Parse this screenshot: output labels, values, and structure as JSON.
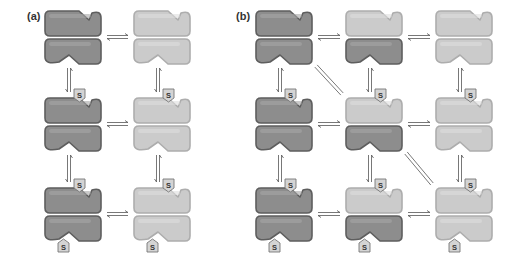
{
  "panels": [
    {
      "label": "(a)",
      "label_pos": [
        27,
        20
      ],
      "columns_x": [
        45,
        134
      ],
      "rows_y": [
        11,
        98,
        188
      ],
      "states": [
        {
          "row": 0,
          "col": 0,
          "top": "dark",
          "bottom": "dark",
          "s_top": false,
          "s_bottom": false
        },
        {
          "row": 0,
          "col": 1,
          "top": "light",
          "bottom": "light",
          "s_top": false,
          "s_bottom": false
        },
        {
          "row": 1,
          "col": 0,
          "top": "dark",
          "bottom": "dark",
          "s_top": true,
          "s_bottom": false
        },
        {
          "row": 1,
          "col": 1,
          "top": "light",
          "bottom": "light",
          "s_top": true,
          "s_bottom": false
        },
        {
          "row": 2,
          "col": 0,
          "top": "dark",
          "bottom": "dark",
          "s_top": true,
          "s_bottom": true
        },
        {
          "row": 2,
          "col": 1,
          "top": "light",
          "bottom": "light",
          "s_top": true,
          "s_bottom": true
        }
      ],
      "h_arrows": [
        [
          0,
          0
        ],
        [
          1,
          0
        ],
        [
          2,
          0
        ]
      ],
      "v_arrows": [
        [
          0,
          0
        ],
        [
          0,
          1
        ],
        [
          1,
          0
        ],
        [
          1,
          1
        ]
      ],
      "d_arrows": []
    },
    {
      "label": "(b)",
      "label_pos": [
        236,
        20
      ],
      "columns_x": [
        256,
        346,
        436
      ],
      "rows_y": [
        11,
        98,
        188
      ],
      "states": [
        {
          "row": 0,
          "col": 0,
          "top": "dark",
          "bottom": "dark",
          "s_top": false,
          "s_bottom": false
        },
        {
          "row": 0,
          "col": 1,
          "top": "light",
          "bottom": "dark",
          "s_top": false,
          "s_bottom": false
        },
        {
          "row": 0,
          "col": 2,
          "top": "light",
          "bottom": "light",
          "s_top": false,
          "s_bottom": false
        },
        {
          "row": 1,
          "col": 0,
          "top": "dark",
          "bottom": "dark",
          "s_top": true,
          "s_bottom": false
        },
        {
          "row": 1,
          "col": 1,
          "top": "light",
          "bottom": "dark",
          "s_top": true,
          "s_bottom": false
        },
        {
          "row": 1,
          "col": 2,
          "top": "light",
          "bottom": "light",
          "s_top": true,
          "s_bottom": false
        },
        {
          "row": 2,
          "col": 0,
          "top": "dark",
          "bottom": "dark",
          "s_top": true,
          "s_bottom": true
        },
        {
          "row": 2,
          "col": 1,
          "top": "light",
          "bottom": "dark",
          "s_top": true,
          "s_bottom": true
        },
        {
          "row": 2,
          "col": 2,
          "top": "light",
          "bottom": "light",
          "s_top": true,
          "s_bottom": true
        }
      ],
      "h_arrows": [
        [
          0,
          0
        ],
        [
          0,
          1
        ],
        [
          1,
          0
        ],
        [
          1,
          1
        ],
        [
          2,
          0
        ],
        [
          2,
          1
        ]
      ],
      "v_arrows": [
        [
          0,
          0
        ],
        [
          0,
          1
        ],
        [
          0,
          2
        ],
        [
          1,
          0
        ],
        [
          1,
          1
        ],
        [
          1,
          2
        ]
      ],
      "d_arrows": [
        [
          0,
          0
        ],
        [
          1,
          1
        ]
      ]
    }
  ],
  "substrate_label": "S",
  "colors": {
    "dark_fill": "#8d8d8d",
    "dark_stroke": "#5e5e5e",
    "dark_highlight": "#a6a6a6",
    "light_fill": "#cbcbcb",
    "light_stroke": "#adadad",
    "light_highlight": "#dedede",
    "arrow": "#555555",
    "badge_fill": "#d4d4d4",
    "badge_stroke": "#777777"
  }
}
